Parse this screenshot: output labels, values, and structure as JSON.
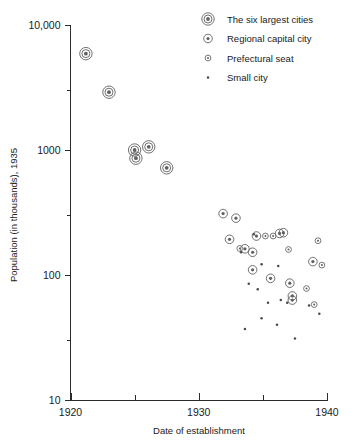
{
  "chart_data": {
    "type": "scatter",
    "title": "",
    "xlabel": "Date of establishment",
    "ylabel": "Population (in thousands), 1935",
    "xlim": [
      1920,
      1940
    ],
    "ylim": [
      10,
      10000
    ],
    "yscale": "log",
    "grid": false,
    "legend_position": "top-right",
    "x_ticks": [
      {
        "value": 1920,
        "label": "1920",
        "major": true
      },
      {
        "value": 1925,
        "label": "",
        "major": false
      },
      {
        "value": 1930,
        "label": "1930",
        "major": true
      },
      {
        "value": 1935,
        "label": "",
        "major": false
      },
      {
        "value": 1940,
        "label": "1940",
        "major": true
      }
    ],
    "y_ticks": [
      {
        "value": 10,
        "label": "10",
        "major": true
      },
      {
        "value": 30,
        "label": "",
        "major": false
      },
      {
        "value": 100,
        "label": "100",
        "major": true
      },
      {
        "value": 300,
        "label": "",
        "major": false
      },
      {
        "value": 1000,
        "label": "1000",
        "major": true
      },
      {
        "value": 3000,
        "label": "",
        "major": false
      },
      {
        "value": 10000,
        "label": "10,000",
        "major": true
      }
    ],
    "series": [
      {
        "name": "The six largest cities",
        "marker": "double-ring",
        "points": [
          {
            "x": 1921.2,
            "y": 5900
          },
          {
            "x": 1923.0,
            "y": 2900
          },
          {
            "x": 1925.0,
            "y": 1000
          },
          {
            "x": 1925.1,
            "y": 860
          },
          {
            "x": 1926.1,
            "y": 1060
          },
          {
            "x": 1927.5,
            "y": 720
          }
        ]
      },
      {
        "name": "Regional capital city",
        "marker": "ring-dot",
        "points": [
          {
            "x": 1931.9,
            "y": 310
          },
          {
            "x": 1932.9,
            "y": 285
          },
          {
            "x": 1932.4,
            "y": 193
          },
          {
            "x": 1934.5,
            "y": 205
          },
          {
            "x": 1936.3,
            "y": 215
          },
          {
            "x": 1936.6,
            "y": 218
          },
          {
            "x": 1934.2,
            "y": 152
          },
          {
            "x": 1934.2,
            "y": 110
          },
          {
            "x": 1935.6,
            "y": 94
          },
          {
            "x": 1937.1,
            "y": 86
          },
          {
            "x": 1937.3,
            "y": 68
          },
          {
            "x": 1937.3,
            "y": 63
          },
          {
            "x": 1933.6,
            "y": 162
          },
          {
            "x": 1938.9,
            "y": 128
          }
        ]
      },
      {
        "name": "Prefectural seat",
        "marker": "small-ring",
        "points": [
          {
            "x": 1935.8,
            "y": 205
          },
          {
            "x": 1937.0,
            "y": 160
          },
          {
            "x": 1939.3,
            "y": 188
          },
          {
            "x": 1933.2,
            "y": 163
          },
          {
            "x": 1939.6,
            "y": 120
          },
          {
            "x": 1938.4,
            "y": 78
          },
          {
            "x": 1935.2,
            "y": 205
          },
          {
            "x": 1939.0,
            "y": 58
          }
        ]
      },
      {
        "name": "Small city",
        "marker": "dot",
        "points": [
          {
            "x": 1934.3,
            "y": 212
          },
          {
            "x": 1933.3,
            "y": 152
          },
          {
            "x": 1934.9,
            "y": 122
          },
          {
            "x": 1936.2,
            "y": 118
          },
          {
            "x": 1933.9,
            "y": 85
          },
          {
            "x": 1934.6,
            "y": 77
          },
          {
            "x": 1935.4,
            "y": 60
          },
          {
            "x": 1936.4,
            "y": 63
          },
          {
            "x": 1936.9,
            "y": 60
          },
          {
            "x": 1938.6,
            "y": 57
          },
          {
            "x": 1934.9,
            "y": 45
          },
          {
            "x": 1936.1,
            "y": 40
          },
          {
            "x": 1933.6,
            "y": 37
          },
          {
            "x": 1937.5,
            "y": 31
          },
          {
            "x": 1939.4,
            "y": 49
          }
        ]
      }
    ],
    "legend": [
      {
        "label": "The six largest cities",
        "marker": "double-ring"
      },
      {
        "label": "Regional capital city",
        "marker": "ring-dot"
      },
      {
        "label": "Prefectural seat",
        "marker": "small-ring"
      },
      {
        "label": "Small city",
        "marker": "dot"
      }
    ],
    "colors": {
      "axis": "#2b2b2b",
      "marker": "#606060",
      "text": "#1a1a1a",
      "background": "#ffffff"
    }
  }
}
